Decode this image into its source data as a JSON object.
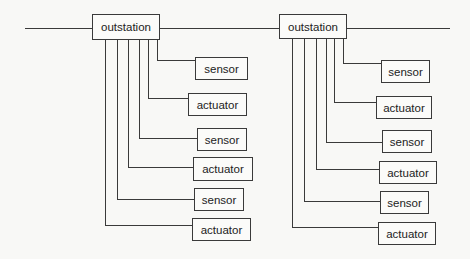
{
  "diagram": {
    "type": "bus-topology",
    "bus_line": {
      "x1": 25,
      "x2": 450,
      "y": 28
    },
    "colors": {
      "line": "#3a3a3a",
      "background": "#f8f8f6",
      "text": "#222222"
    },
    "groups": [
      {
        "outstation": {
          "label": "outstation",
          "x": 92,
          "y": 14,
          "w": 68,
          "h": 26
        },
        "devices": [
          {
            "label": "sensor",
            "kind": "sensor",
            "x": 195,
            "y": 57,
            "w": 53,
            "h": 23,
            "tap_x": 157,
            "line_y": 60
          },
          {
            "label": "actuator",
            "kind": "actuator",
            "x": 188,
            "y": 93,
            "w": 59,
            "h": 23,
            "tap_x": 148,
            "line_y": 98
          },
          {
            "label": "sensor",
            "kind": "sensor",
            "x": 197,
            "y": 128,
            "w": 50,
            "h": 23,
            "tap_x": 139,
            "line_y": 138
          },
          {
            "label": "actuator",
            "kind": "actuator",
            "x": 193,
            "y": 157,
            "w": 60,
            "h": 24,
            "tap_x": 128,
            "line_y": 167
          },
          {
            "label": "sensor",
            "kind": "sensor",
            "x": 194,
            "y": 188,
            "w": 50,
            "h": 23,
            "tap_x": 117,
            "line_y": 199
          },
          {
            "label": "actuator",
            "kind": "actuator",
            "x": 192,
            "y": 218,
            "w": 59,
            "h": 23,
            "tap_x": 105,
            "line_y": 225
          }
        ]
      },
      {
        "outstation": {
          "label": "outstation",
          "x": 279,
          "y": 14,
          "w": 68,
          "h": 25
        },
        "devices": [
          {
            "label": "sensor",
            "kind": "sensor",
            "x": 381,
            "y": 60,
            "w": 49,
            "h": 23,
            "tap_x": 343,
            "line_y": 63
          },
          {
            "label": "actuator",
            "kind": "actuator",
            "x": 376,
            "y": 96,
            "w": 56,
            "h": 23,
            "tap_x": 334,
            "line_y": 102
          },
          {
            "label": "sensor",
            "kind": "sensor",
            "x": 382,
            "y": 130,
            "w": 50,
            "h": 23,
            "tap_x": 326,
            "line_y": 142
          },
          {
            "label": "actuator",
            "kind": "actuator",
            "x": 379,
            "y": 161,
            "w": 58,
            "h": 23,
            "tap_x": 316,
            "line_y": 169
          },
          {
            "label": "sensor",
            "kind": "sensor",
            "x": 380,
            "y": 191,
            "w": 49,
            "h": 23,
            "tap_x": 304,
            "line_y": 201
          },
          {
            "label": "actuator",
            "kind": "actuator",
            "x": 378,
            "y": 222,
            "w": 58,
            "h": 23,
            "tap_x": 292,
            "line_y": 227
          }
        ]
      }
    ]
  }
}
